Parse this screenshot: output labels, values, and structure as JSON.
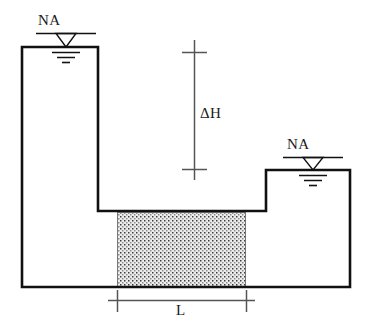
{
  "figure": {
    "type": "engineering-cross-section-diagram",
    "width": 367,
    "height": 335,
    "background_color": "#ffffff",
    "line_color": "#111111",
    "soil_fill_color": "#e8e8e8",
    "soil_dot_color": "#3a3a3a",
    "dimension_line_color": "#4a4a4a"
  },
  "labels": {
    "na_left": "NA",
    "na_right": "NA",
    "delta_h": "ΔH",
    "length": "L"
  },
  "annotations": {
    "na_left": {
      "text": "NA",
      "meaning": "water-table-symbol-left",
      "x": 38,
      "y": 13
    },
    "na_right": {
      "text": "NA",
      "meaning": "water-table-symbol-right",
      "x": 287,
      "y": 137
    },
    "delta_h": {
      "text": "ΔH",
      "meaning": "head-difference-dimension",
      "x": 200,
      "y": 106
    },
    "length": {
      "text": "L",
      "meaning": "soil-layer-length-dimension",
      "x": 176,
      "y": 303
    }
  },
  "geometry": {
    "vessel_outline_points": "22,47 98,47 98,211 266,211 266,170 350,170 350,287 22,287",
    "left_reservoir": {
      "left": 22,
      "right": 98,
      "top": 47,
      "bottom": 287
    },
    "right_reservoir": {
      "left": 266,
      "right": 350,
      "top": 170,
      "bottom": 287
    },
    "soil_block": {
      "left": 117,
      "right": 246,
      "top": 212,
      "bottom": 287
    },
    "trench_floor_y": 211,
    "delta_h_dimension": {
      "x": 194,
      "y_top": 40,
      "y_bottom": 180,
      "tick_top_y": 52,
      "tick_bottom_y": 169,
      "tick_half_width": 12
    },
    "length_dimension": {
      "y": 300,
      "x_left": 108,
      "x_right": 255,
      "tick_left_x": 117,
      "tick_right_x": 246,
      "tick_half_height": 11
    },
    "water_symbol_left": {
      "rule_y": 33,
      "rule_x1": 36,
      "rule_x2": 96,
      "triangle_cx": 66,
      "triangle_half_width": 10,
      "triangle_apex_y": 47,
      "sub_lines": [
        {
          "y": 52,
          "x1": 52,
          "x2": 80
        },
        {
          "y": 57,
          "x1": 57,
          "x2": 75
        },
        {
          "y": 62,
          "x1": 62,
          "x2": 70
        }
      ]
    },
    "water_symbol_right": {
      "rule_y": 157,
      "rule_x1": 283,
      "rule_x2": 343,
      "triangle_cx": 313,
      "triangle_half_width": 10,
      "triangle_apex_y": 170,
      "sub_lines": [
        {
          "y": 175,
          "x1": 299,
          "x2": 327
        },
        {
          "y": 180,
          "x1": 304,
          "x2": 322
        },
        {
          "y": 185,
          "x1": 309,
          "x2": 317
        }
      ]
    }
  }
}
